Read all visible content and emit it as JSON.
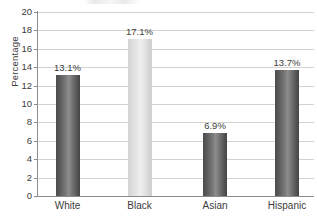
{
  "chart_data": {
    "type": "bar",
    "title": "",
    "subtitle": "",
    "xlabel": "",
    "ylabel": "Percentage",
    "categories": [
      "White",
      "Black",
      "Asian",
      "Hispanic"
    ],
    "values": [
      13.1,
      17.1,
      6.9,
      13.7
    ],
    "value_labels": [
      "13.1%",
      "17.1%",
      "6.9%",
      "13.7%"
    ],
    "ylim": [
      0,
      20
    ],
    "y_ticks": [
      0,
      2,
      4,
      6,
      8,
      10,
      12,
      14,
      16,
      18,
      20
    ],
    "y_tick_labels": [
      "0",
      "2",
      "4",
      "6",
      "8",
      "10",
      "12",
      "14",
      "16",
      "18",
      "20"
    ],
    "grid": true,
    "grid_axis": "y",
    "legend": false,
    "legend_position": "none",
    "bar_colors": [
      "#6e6e6e",
      "#e0e0e0",
      "#6e6e6e",
      "#6e6e6e"
    ],
    "bar_styles": [
      "dark",
      "light",
      "dark",
      "dark"
    ],
    "colors": {
      "bar_dark": "#6e6e6e",
      "bar_light": "#e0e0e0",
      "gridline": "#d2d2d2",
      "axis": "#8c8c8c",
      "text": "#3c3c3c",
      "background": "#ffffff"
    }
  }
}
